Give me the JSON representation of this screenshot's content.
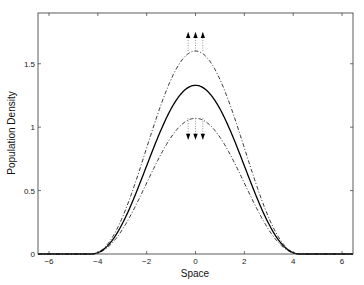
{
  "chart_data": {
    "type": "line",
    "title": "",
    "xlabel": "Space",
    "ylabel": "Population Density",
    "xlim": [
      -6.45,
      6.45
    ],
    "ylim": [
      0,
      1.9
    ],
    "xticks": [
      -6,
      -4,
      -2,
      0,
      2,
      4,
      6
    ],
    "xtick_labels": [
      "-6",
      "-4",
      "-2",
      "0",
      "2",
      "4",
      "6"
    ],
    "yticks": [
      0,
      0.5,
      1,
      1.5
    ],
    "ytick_labels": [
      "0",
      "0.5",
      "1",
      "1.5"
    ],
    "grid": false,
    "legend": null,
    "support": [
      -4.3,
      4.3
    ],
    "series": [
      {
        "name": "upper",
        "style": "dash-dot",
        "peak": 1.6
      },
      {
        "name": "center",
        "style": "solid",
        "peak": 1.33
      },
      {
        "name": "lower",
        "style": "dash-dot",
        "peak": 1.07
      }
    ],
    "annotations": [
      {
        "type": "arrows-up",
        "x": [
          -0.3,
          0,
          0.3
        ],
        "from": 1.6,
        "to": 1.75,
        "style": "dotted"
      },
      {
        "type": "arrows-down",
        "x": [
          -0.3,
          0,
          0.3
        ],
        "from": 1.07,
        "to": 0.9,
        "style": "dotted"
      }
    ]
  }
}
